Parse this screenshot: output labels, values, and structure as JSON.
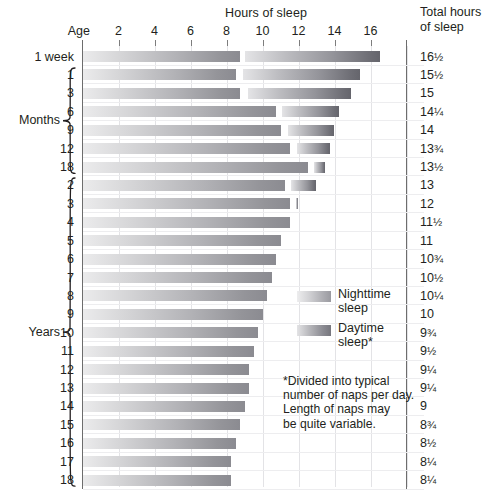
{
  "header": {
    "hours_title": "Hours of sleep",
    "age_title": "Age",
    "total_title_line1": "Total hours",
    "total_title_line2": "of sleep"
  },
  "groups": [
    {
      "name": "months-group",
      "label": "Months"
    },
    {
      "name": "years-group",
      "label": "Years"
    }
  ],
  "legend": {
    "night_label_line1": "Nighttime",
    "night_label_line2": "sleep",
    "day_label_line1": "Daytime",
    "day_label_line2": "sleep*",
    "night_color": "#aeaeb3",
    "day_color": "#8c8c93"
  },
  "footnote": {
    "line1": "*Divided into typical",
    "line2": "number of naps per day.",
    "line3": "Length of naps may",
    "line4": "be quite variable."
  },
  "chart_data": {
    "type": "bar",
    "title": "Hours of sleep",
    "xlabel": "Hours of sleep",
    "ylabel": "Age",
    "xlim": [
      0,
      19
    ],
    "grid": true,
    "legend_position": "inside-right",
    "xticks": [
      2,
      4,
      6,
      8,
      10,
      12,
      14,
      16
    ],
    "categories": [
      "1 week",
      "1",
      "3",
      "6",
      "9",
      "12",
      "18",
      "2",
      "3",
      "4",
      "5",
      "6",
      "7",
      "8",
      "9",
      "10",
      "11",
      "12",
      "13",
      "14",
      "15",
      "16",
      "17",
      "18"
    ],
    "series": [
      {
        "name": "Nighttime sleep",
        "values": [
          8.75,
          8.5,
          8.75,
          10.75,
          11,
          11.5,
          12.5,
          11.25,
          11.5,
          11.5,
          11,
          10.75,
          10.5,
          10.25,
          10,
          9.75,
          9.5,
          9.25,
          9.25,
          9,
          8.75,
          8.5,
          8.25,
          8.25
        ]
      },
      {
        "name": "Daytime sleep",
        "values": [
          7.75,
          7,
          6.25,
          3.5,
          3,
          2.25,
          1,
          1.75,
          0.5,
          0,
          0,
          0,
          0,
          0,
          0,
          0,
          0,
          0,
          0,
          0,
          0,
          0,
          0,
          0
        ]
      }
    ],
    "rows": [
      {
        "age": "1 week",
        "group": "week",
        "night_start": 0,
        "night_end": 8.75,
        "day_start": 9.0,
        "day_end": 16.5,
        "total": "16",
        "total_frac": "1/2"
      },
      {
        "age": "1",
        "group": "months",
        "night_start": 0,
        "night_end": 8.5,
        "day_start": 8.9,
        "day_end": 15.4,
        "total": "15",
        "total_frac": "1/2"
      },
      {
        "age": "3",
        "group": "months",
        "night_start": 0,
        "night_end": 8.75,
        "day_start": 9.2,
        "day_end": 14.9,
        "total": "15",
        "total_frac": ""
      },
      {
        "age": "6",
        "group": "months",
        "night_start": 0,
        "night_end": 10.75,
        "day_start": 11.1,
        "day_end": 14.25,
        "total": "14",
        "total_frac": "1/4"
      },
      {
        "age": "9",
        "group": "months",
        "night_start": 0,
        "night_end": 11.0,
        "day_start": 11.4,
        "day_end": 14.0,
        "total": "14",
        "total_frac": ""
      },
      {
        "age": "12",
        "group": "months",
        "night_start": 0,
        "night_end": 11.5,
        "day_start": 11.9,
        "day_end": 13.75,
        "total": "13",
        "total_frac": "3/4"
      },
      {
        "age": "18",
        "group": "months",
        "night_start": 0,
        "night_end": 12.5,
        "day_start": 12.85,
        "day_end": 13.5,
        "total": "13",
        "total_frac": "1/2"
      },
      {
        "age": "2",
        "group": "years",
        "night_start": 0,
        "night_end": 11.25,
        "day_start": 11.6,
        "day_end": 13.0,
        "total": "13",
        "total_frac": ""
      },
      {
        "age": "3",
        "group": "years",
        "night_start": 0,
        "night_end": 11.5,
        "day_start": 11.85,
        "day_end": 12.0,
        "total": "12",
        "total_frac": ""
      },
      {
        "age": "4",
        "group": "years",
        "night_start": 0,
        "night_end": 11.5,
        "day_start": 0,
        "day_end": 0,
        "total": "11",
        "total_frac": "1/2"
      },
      {
        "age": "5",
        "group": "years",
        "night_start": 0,
        "night_end": 11.0,
        "day_start": 0,
        "day_end": 0,
        "total": "11",
        "total_frac": ""
      },
      {
        "age": "6",
        "group": "years",
        "night_start": 0,
        "night_end": 10.75,
        "day_start": 0,
        "day_end": 0,
        "total": "10",
        "total_frac": "3/4"
      },
      {
        "age": "7",
        "group": "years",
        "night_start": 0,
        "night_end": 10.5,
        "day_start": 0,
        "day_end": 0,
        "total": "10",
        "total_frac": "1/2"
      },
      {
        "age": "8",
        "group": "years",
        "night_start": 0,
        "night_end": 10.25,
        "day_start": 0,
        "day_end": 0,
        "total": "10",
        "total_frac": "1/4"
      },
      {
        "age": "9",
        "group": "years",
        "night_start": 0,
        "night_end": 10.0,
        "day_start": 0,
        "day_end": 0,
        "total": "10",
        "total_frac": ""
      },
      {
        "age": "10",
        "group": "years",
        "night_start": 0,
        "night_end": 9.75,
        "day_start": 0,
        "day_end": 0,
        "total": "9",
        "total_frac": "3/4"
      },
      {
        "age": "11",
        "group": "years",
        "night_start": 0,
        "night_end": 9.5,
        "day_start": 0,
        "day_end": 0,
        "total": "9",
        "total_frac": "1/2"
      },
      {
        "age": "12",
        "group": "years",
        "night_start": 0,
        "night_end": 9.25,
        "day_start": 0,
        "day_end": 0,
        "total": "9",
        "total_frac": "1/4"
      },
      {
        "age": "13",
        "group": "years",
        "night_start": 0,
        "night_end": 9.25,
        "day_start": 0,
        "day_end": 0,
        "total": "9",
        "total_frac": "1/4"
      },
      {
        "age": "14",
        "group": "years",
        "night_start": 0,
        "night_end": 9.0,
        "day_start": 0,
        "day_end": 0,
        "total": "9",
        "total_frac": ""
      },
      {
        "age": "15",
        "group": "years",
        "night_start": 0,
        "night_end": 8.75,
        "day_start": 0,
        "day_end": 0,
        "total": "8",
        "total_frac": "3/4"
      },
      {
        "age": "16",
        "group": "years",
        "night_start": 0,
        "night_end": 8.5,
        "day_start": 0,
        "day_end": 0,
        "total": "8",
        "total_frac": "1/2"
      },
      {
        "age": "17",
        "group": "years",
        "night_start": 0,
        "night_end": 8.25,
        "day_start": 0,
        "day_end": 0,
        "total": "8",
        "total_frac": "1/4"
      },
      {
        "age": "18",
        "group": "years",
        "night_start": 0,
        "night_end": 8.25,
        "day_start": 0,
        "day_end": 0,
        "total": "8",
        "total_frac": "1/4"
      }
    ]
  }
}
